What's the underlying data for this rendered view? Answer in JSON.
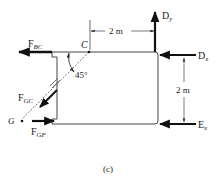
{
  "figure": {
    "caption": "(c)",
    "type": "free-body diagram",
    "line_color": "#444444",
    "force_color": "#111111"
  },
  "points": {
    "C": {
      "label": "C"
    },
    "G": {
      "label": "G"
    }
  },
  "forces": {
    "FBC": {
      "main": "F",
      "sub": "BC",
      "direction": "left"
    },
    "FGC": {
      "main": "F",
      "sub": "GC",
      "direction": "down-left"
    },
    "FGF": {
      "main": "F",
      "sub": "GF",
      "direction": "right"
    },
    "Dy": {
      "main": "D",
      "sub": "y",
      "direction": "up"
    },
    "Dx": {
      "main": "D",
      "sub": "x",
      "direction": "left"
    },
    "Ex": {
      "main": "E",
      "sub": "x",
      "direction": "left"
    }
  },
  "dimensions": {
    "horizontal": "2 m",
    "vertical": "2 m"
  },
  "angle": {
    "label": "45°"
  }
}
